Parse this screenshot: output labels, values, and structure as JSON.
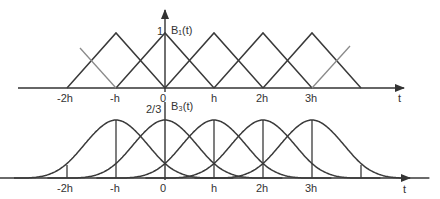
{
  "figure": {
    "top_panel": {
      "function_label": "B₁(t)",
      "peak_label": "1",
      "axis_label": "t",
      "ticks": [
        "-2h",
        "-h",
        "0",
        "h",
        "2h",
        "3h"
      ],
      "basis": "linear hat functions (degree 1 B-splines)",
      "centers": [
        "-h",
        "0",
        "h",
        "2h",
        "3h"
      ],
      "peak_value": 1
    },
    "bottom_panel": {
      "function_label": "B₃(t)",
      "peak_label": "2/3",
      "axis_label": "t",
      "ticks": [
        "-2h",
        "-h",
        "0",
        "h",
        "2h",
        "3h"
      ],
      "basis": "cubic B-splines (degree 3)",
      "centers": [
        "-h",
        "0",
        "h",
        "2h",
        "3h"
      ],
      "peak_value": "2/3"
    },
    "colors": {
      "line": "#3a3a3a",
      "faint_line": "#8a8a8a",
      "text": "#333333"
    }
  }
}
